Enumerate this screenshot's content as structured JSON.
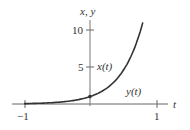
{
  "chart_data": {
    "type": "line",
    "title": "",
    "xlabel": "t",
    "ylabel": "x, y",
    "xlim": [
      -1.15,
      1.2
    ],
    "ylim": [
      -0.8,
      12
    ],
    "x_ticks": [
      -1,
      1
    ],
    "x_tick_labels": [
      "−1",
      "1"
    ],
    "y_ticks": [
      5,
      10
    ],
    "y_tick_labels": [
      "5",
      "10"
    ],
    "grid": false,
    "legend": null,
    "series": [
      {
        "name": "x(t)",
        "label": "x(t)",
        "formula": "e^{3t}",
        "x": [
          -1,
          -0.8,
          -0.6,
          -0.4,
          -0.2,
          0,
          0.2,
          0.4,
          0.6,
          0.8
        ],
        "values": [
          0.05,
          0.09,
          0.17,
          0.3,
          0.55,
          1.0,
          1.82,
          3.32,
          6.05,
          11.02
        ]
      },
      {
        "name": "y(t)",
        "label": "y(t)",
        "formula": "0",
        "x": [
          -1,
          1
        ],
        "values": [
          0,
          0
        ]
      }
    ],
    "annotations": [
      {
        "text": "x(t)",
        "near": "curve at value 5"
      },
      {
        "text": "y(t)",
        "near": "t-axis right of origin"
      },
      {
        "text": "point",
        "at": [
          0,
          1
        ]
      }
    ]
  },
  "labels": {
    "y_axis": "x, y",
    "x_axis": "t",
    "tick_10": "10",
    "tick_5": "5",
    "tick_neg1": "−1",
    "tick_1": "1",
    "series_x": "x(t)",
    "series_y": "y(t)"
  },
  "colors": {
    "axis": "#555555",
    "curve": "#333333"
  }
}
